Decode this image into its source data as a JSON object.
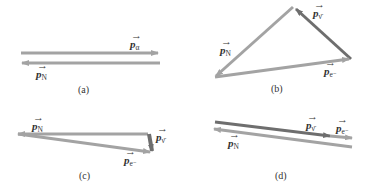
{
  "colors": {
    "light_arrow": "#a3a3a3",
    "dark_arrow": "#6e6e6e",
    "text": "#333333"
  },
  "panels": [
    {
      "caption": "(a)",
      "vectors": [
        {
          "symbol": "p",
          "subscript": "α",
          "name": "p-alpha",
          "shade": "light"
        },
        {
          "symbol": "p",
          "subscript": "N",
          "name": "p-nucleus",
          "shade": "light"
        }
      ]
    },
    {
      "caption": "(b)",
      "vectors": [
        {
          "symbol": "p",
          "subscript": "N",
          "name": "p-nucleus",
          "shade": "light"
        },
        {
          "symbol": "p",
          "subscript": "ν̄",
          "name": "p-antineutrino",
          "shade": "dark"
        },
        {
          "symbol": "p",
          "subscript": "e⁻",
          "name": "p-electron",
          "shade": "light"
        }
      ]
    },
    {
      "caption": "(c)",
      "vectors": [
        {
          "symbol": "p",
          "subscript": "N",
          "name": "p-nucleus",
          "shade": "light"
        },
        {
          "symbol": "p",
          "subscript": "ν̄",
          "name": "p-antineutrino",
          "shade": "dark"
        },
        {
          "symbol": "p",
          "subscript": "e⁻",
          "name": "p-electron",
          "shade": "light"
        }
      ]
    },
    {
      "caption": "(d)",
      "vectors": [
        {
          "symbol": "p",
          "subscript": "ν̄",
          "name": "p-antineutrino",
          "shade": "dark"
        },
        {
          "symbol": "p",
          "subscript": "e⁻",
          "name": "p-electron",
          "shade": "light"
        },
        {
          "symbol": "p",
          "subscript": "N",
          "name": "p-nucleus",
          "shade": "light"
        }
      ]
    }
  ]
}
